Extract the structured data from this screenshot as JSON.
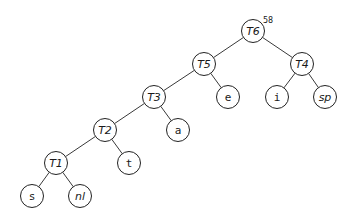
{
  "diagram": {
    "type": "binary-tree",
    "root_weight": "58",
    "nodes": [
      {
        "id": "T6",
        "label": "T6",
        "x": 253,
        "y": 31,
        "style": "internal"
      },
      {
        "id": "T5",
        "label": "T5",
        "x": 204,
        "y": 64,
        "style": "internal"
      },
      {
        "id": "T4",
        "label": "T4",
        "x": 302,
        "y": 64,
        "style": "internal"
      },
      {
        "id": "T3",
        "label": "T3",
        "x": 154,
        "y": 97,
        "style": "internal"
      },
      {
        "id": "e",
        "label": "e",
        "x": 228,
        "y": 97,
        "style": "leaf"
      },
      {
        "id": "i",
        "label": "i",
        "x": 277,
        "y": 97,
        "style": "leaf"
      },
      {
        "id": "sp",
        "label": "sp",
        "x": 325,
        "y": 97,
        "style": "special"
      },
      {
        "id": "T2",
        "label": "T2",
        "x": 105,
        "y": 130,
        "style": "internal"
      },
      {
        "id": "a",
        "label": "a",
        "x": 178,
        "y": 130,
        "style": "leaf"
      },
      {
        "id": "T1",
        "label": "T1",
        "x": 56,
        "y": 163,
        "style": "internal"
      },
      {
        "id": "t",
        "label": "t",
        "x": 129,
        "y": 163,
        "style": "leaf"
      },
      {
        "id": "s",
        "label": "s",
        "x": 32,
        "y": 196,
        "style": "leaf"
      },
      {
        "id": "nl",
        "label": "nl",
        "x": 80,
        "y": 196,
        "style": "special"
      }
    ],
    "edges": [
      [
        "T6",
        "T5"
      ],
      [
        "T6",
        "T4"
      ],
      [
        "T5",
        "T3"
      ],
      [
        "T5",
        "e"
      ],
      [
        "T4",
        "i"
      ],
      [
        "T4",
        "sp"
      ],
      [
        "T3",
        "T2"
      ],
      [
        "T3",
        "a"
      ],
      [
        "T2",
        "T1"
      ],
      [
        "T2",
        "t"
      ],
      [
        "T1",
        "s"
      ],
      [
        "T1",
        "nl"
      ]
    ],
    "node_radius": 11.5
  }
}
